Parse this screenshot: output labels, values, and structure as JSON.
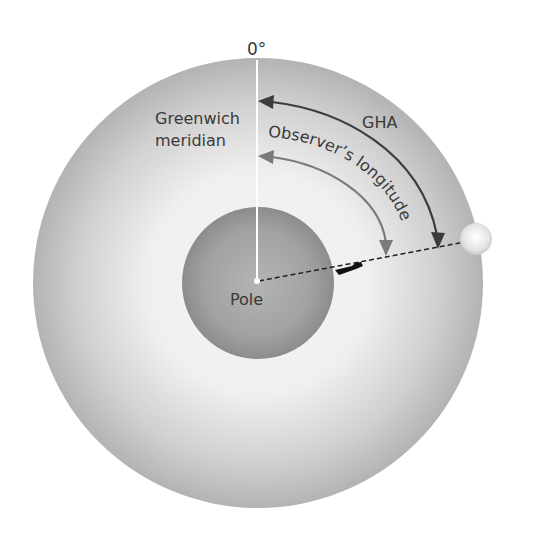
{
  "diagram": {
    "title_zero": "0°",
    "greenwich_line1": "Greenwich",
    "greenwich_line2": "meridian",
    "gha_label": "GHA",
    "observer_label": "Observer’s longitude",
    "pole_label": "Pole",
    "colors": {
      "outer_edge": "#b3b3b3",
      "outer_center": "#f4f4f4",
      "inner_edge": "#8f8f8f",
      "inner_center": "#b0b0b0",
      "gha_arrow": "#3c3c3c",
      "observer_arrow": "#7a7a7a",
      "meridian": "#ffffff"
    }
  }
}
